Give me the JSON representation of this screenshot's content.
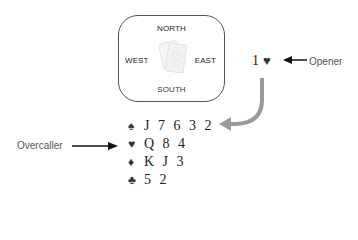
{
  "table": {
    "north": "NORTH",
    "south": "SOUTH",
    "east": "EAST",
    "west": "WEST"
  },
  "bid": {
    "level": "1",
    "suit_symbol": "♥",
    "suit": "hearts"
  },
  "labels": {
    "opener": "Opener",
    "overcaller": "Overcaller"
  },
  "hand": {
    "rows": [
      {
        "suit": "spades",
        "symbol": "♠",
        "cards": "J7632"
      },
      {
        "suit": "hearts",
        "symbol": "♥",
        "cards": "Q84"
      },
      {
        "suit": "diamonds",
        "symbol": "♦",
        "cards": "KJ3"
      },
      {
        "suit": "clubs",
        "symbol": "♣",
        "cards": "52"
      }
    ],
    "display": [
      "J 7 6 3 2",
      "Q 8 4",
      "K J 3",
      "5 2"
    ]
  },
  "colors": {
    "arrow_black": "#111111",
    "curve_arrow": "#999999",
    "box_border": "#555555",
    "label_text": "#555555"
  }
}
